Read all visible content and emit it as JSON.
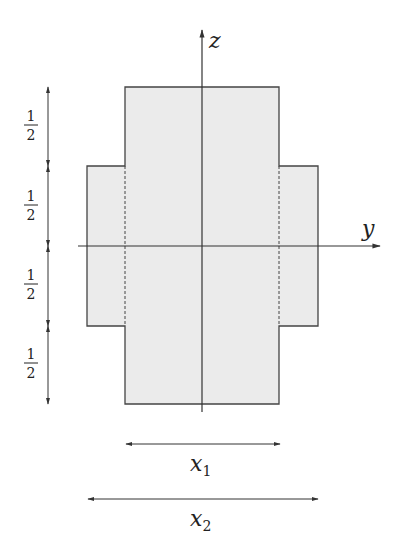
{
  "diagram": {
    "axes": {
      "z_label": "z",
      "y_label": "y"
    },
    "dimensions": {
      "x1_label": "x",
      "x1_sub": "1",
      "x2_label": "x",
      "x2_sub": "2",
      "vertical_segments": [
        {
          "num": "1",
          "den": "2"
        },
        {
          "num": "1",
          "den": "2"
        },
        {
          "num": "1",
          "den": "2"
        },
        {
          "num": "1",
          "den": "2"
        }
      ]
    },
    "colors": {
      "fill": "#ebebeb",
      "stroke": "#333333"
    }
  }
}
